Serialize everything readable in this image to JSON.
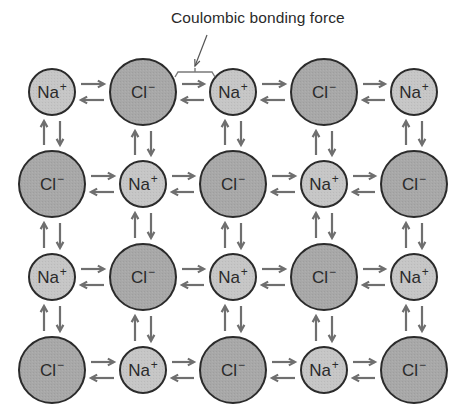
{
  "figure": {
    "caption": "Coulombic bonding force"
  },
  "ions": {
    "cation": {
      "symbol": "Na",
      "charge": "+",
      "radius": 23,
      "fill": "#c6c6c6"
    },
    "anion": {
      "symbol": "Cl",
      "charge": "−",
      "radius": 33,
      "fill": "#a8a8a8"
    }
  },
  "lattice": {
    "columns_x": [
      52,
      143,
      233,
      324,
      414
    ],
    "rows_y": [
      92,
      184,
      277,
      370
    ],
    "grid": [
      [
        "Na",
        "Cl",
        "Na",
        "Cl",
        "Na"
      ],
      [
        "Cl",
        "Na",
        "Cl",
        "Na",
        "Cl"
      ],
      [
        "Na",
        "Cl",
        "Na",
        "Cl",
        "Na"
      ],
      [
        "Cl",
        "Na",
        "Cl",
        "Na",
        "Cl"
      ]
    ]
  },
  "colors": {
    "outline": "#2b2b2b",
    "arrow": "#6f6f6f",
    "bracket": "#7a7a7a",
    "text": "#2a2a2a",
    "background": "#ffffff"
  },
  "annotation": {
    "bracket": {
      "x1": 178,
      "x2": 212,
      "y": 72
    },
    "pointer": {
      "from": [
        207,
        35
      ],
      "to": [
        195,
        66
      ]
    }
  }
}
